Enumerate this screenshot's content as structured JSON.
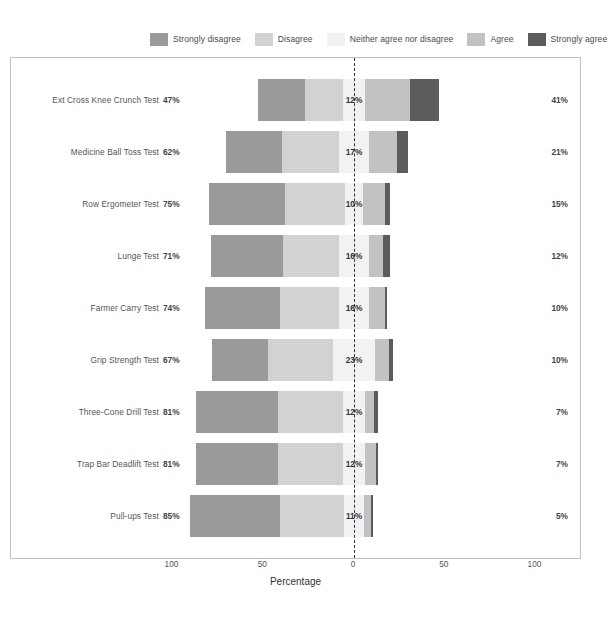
{
  "chart_data": {
    "type": "bar",
    "subtype": "diverging-stacked-likert",
    "title": "",
    "xlabel": "Percentage",
    "ylabel": "",
    "xlim": [
      -100,
      100
    ],
    "xticks": [
      100,
      50,
      0,
      50,
      100
    ],
    "grid": false,
    "legend_position": "top",
    "legend": [
      {
        "label": "Strongly disagree",
        "color": "#9a9a9a"
      },
      {
        "label": "Disagree",
        "color": "#d2d2d2"
      },
      {
        "label": "Neither agree nor disagree",
        "color": "#f2f2f2"
      },
      {
        "label": "Agree",
        "color": "#c2c2c2"
      },
      {
        "label": "Strongly agree",
        "color": "#5c5c5c"
      }
    ],
    "categories": [
      "Ext Cross Knee Crunch Test",
      "Medicine Ball Toss Test",
      "Row Ergometer Test",
      "Lunge Test",
      "Farmer Carry Test",
      "Grip Strength Test",
      "Three-Cone Drill Test",
      "Trap Bar Deadlift Test",
      "Pull-ups Test"
    ],
    "series": [
      {
        "name": "Strongly disagree",
        "color": "#9a9a9a",
        "values": [
          26,
          31,
          42,
          40,
          41,
          31,
          45,
          45,
          50
        ]
      },
      {
        "name": "Disagree",
        "color": "#d2d2d2",
        "values": [
          21,
          31,
          33,
          31,
          33,
          36,
          36,
          36,
          35
        ]
      },
      {
        "name": "Neither agree nor disagree",
        "color": "#f2f2f2",
        "values": [
          12,
          17,
          10,
          16,
          16,
          23,
          12,
          12,
          11
        ]
      },
      {
        "name": "Agree",
        "color": "#c2c2c2",
        "values": [
          25,
          15,
          12,
          8,
          9,
          8,
          5,
          6,
          4
        ]
      },
      {
        "name": "Strongly agree",
        "color": "#5c5c5c",
        "values": [
          16,
          6,
          3,
          4,
          1,
          2,
          2,
          1,
          1
        ]
      }
    ],
    "rows": [
      {
        "category": "Ext Cross Knee Crunch Test",
        "left_total": "47%",
        "middle": "12%",
        "right_total": "41%",
        "strongly_disagree": 26,
        "disagree": 21,
        "neither": 12,
        "agree": 25,
        "strongly_agree": 16
      },
      {
        "category": "Medicine Ball Toss Test",
        "left_total": "62%",
        "middle": "17%",
        "right_total": "21%",
        "strongly_disagree": 31,
        "disagree": 31,
        "neither": 17,
        "agree": 15,
        "strongly_agree": 6
      },
      {
        "category": "Row Ergometer Test",
        "left_total": "75%",
        "middle": "10%",
        "right_total": "15%",
        "strongly_disagree": 42,
        "disagree": 33,
        "neither": 10,
        "agree": 12,
        "strongly_agree": 3
      },
      {
        "category": "Lunge Test",
        "left_total": "71%",
        "middle": "16%",
        "right_total": "12%",
        "strongly_disagree": 40,
        "disagree": 31,
        "neither": 16,
        "agree": 8,
        "strongly_agree": 4
      },
      {
        "category": "Farmer Carry Test",
        "left_total": "74%",
        "middle": "16%",
        "right_total": "10%",
        "strongly_disagree": 41,
        "disagree": 33,
        "neither": 16,
        "agree": 9,
        "strongly_agree": 1
      },
      {
        "category": "Grip Strength Test",
        "left_total": "67%",
        "middle": "23%",
        "right_total": "10%",
        "strongly_disagree": 31,
        "disagree": 36,
        "neither": 23,
        "agree": 8,
        "strongly_agree": 2
      },
      {
        "category": "Three-Cone Drill Test",
        "left_total": "81%",
        "middle": "12%",
        "right_total": "7%",
        "strongly_disagree": 45,
        "disagree": 36,
        "neither": 12,
        "agree": 5,
        "strongly_agree": 2
      },
      {
        "category": "Trap Bar Deadlift Test",
        "left_total": "81%",
        "middle": "12%",
        "right_total": "7%",
        "strongly_disagree": 45,
        "disagree": 36,
        "neither": 12,
        "agree": 6,
        "strongly_agree": 1
      },
      {
        "category": "Pull-ups Test",
        "left_total": "85%",
        "middle": "11%",
        "right_total": "5%",
        "strongly_disagree": 50,
        "disagree": 35,
        "neither": 11,
        "agree": 4,
        "strongly_agree": 1
      }
    ]
  },
  "axis": {
    "ticks": [
      {
        "label": "100",
        "value": -100
      },
      {
        "label": "50",
        "value": -50
      },
      {
        "label": "0",
        "value": 0
      },
      {
        "label": "50",
        "value": 50
      },
      {
        "label": "100",
        "value": 100
      }
    ],
    "xlabel": "Percentage"
  },
  "colors": {
    "strongly_disagree": "#9a9a9a",
    "disagree": "#d2d2d2",
    "neither": "#f2f2f2",
    "agree": "#c2c2c2",
    "strongly_agree": "#5c5c5c",
    "panel_border": "#bfbfbf",
    "text": "#555555"
  }
}
